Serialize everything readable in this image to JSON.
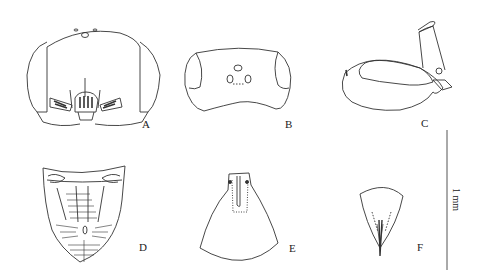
{
  "figure": {
    "panels": [
      {
        "id": "A",
        "label": "A",
        "view": "head, frontal view"
      },
      {
        "id": "B",
        "label": "B",
        "view": "vertex, dorsal view"
      },
      {
        "id": "C",
        "label": "C",
        "view": "head, lateral view"
      },
      {
        "id": "D",
        "label": "D",
        "view": "plate with striations"
      },
      {
        "id": "E",
        "label": "E",
        "view": "plate"
      },
      {
        "id": "F",
        "label": "F",
        "view": "plate"
      }
    ],
    "scale_bar": {
      "label": "1 mm"
    },
    "line_color": "#333333",
    "background": "#ffffff"
  }
}
